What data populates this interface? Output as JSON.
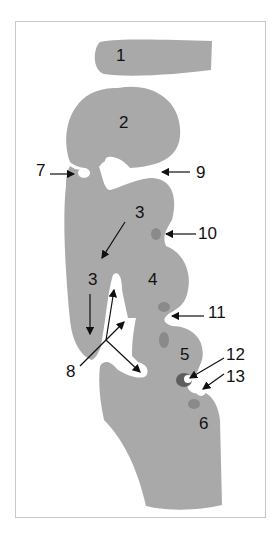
{
  "figure": {
    "colors": {
      "background": "#ffffff",
      "frame": "#c8c8c8",
      "tissue": "#a9a9a9",
      "spot": "#8a8a8a",
      "spot_dark": "#5e5e5e",
      "label": "#111111"
    },
    "labels": {
      "l1": "1",
      "l2": "2",
      "l3a": "3",
      "l3b": "3",
      "l4": "4",
      "l5": "5",
      "l6": "6",
      "l7": "7",
      "l8": "8",
      "l9": "9",
      "l10": "10",
      "l11": "11",
      "l12": "12",
      "l13": "13"
    }
  }
}
